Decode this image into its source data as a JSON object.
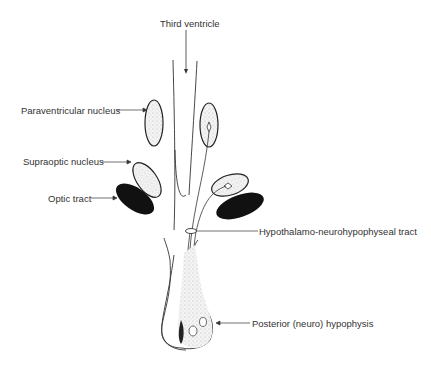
{
  "diagram": {
    "labels": {
      "third_ventricle": "Third ventricle",
      "paraventricular_nucleus": "Paraventricular nucleus",
      "supraoptic_nucleus": "Supraoptic nucleus",
      "optic_tract": "Optic tract",
      "hypothalamo_tract": "Hypothalamo-neurohypophyseal tract",
      "posterior_hypophysis": "Posterior (neuro) hypophysis"
    }
  }
}
